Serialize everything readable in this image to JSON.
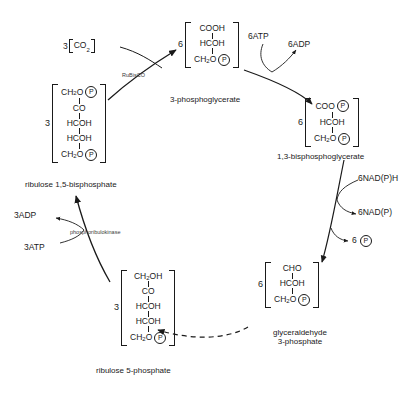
{
  "diagram": {
    "ink_color": "#1a1a1a"
  },
  "molecules": {
    "rubp": {
      "coefficient": "3",
      "groups": [
        "CH",
        "CO",
        "HCOH",
        "HCOH",
        "CH"
      ],
      "g1_main": "CH",
      "g1_sub": "2",
      "g1_tail": "O",
      "g2": "CO",
      "g3": "HCOH",
      "g4": "HCOH",
      "g5_main": "CH",
      "g5_sub": "2",
      "g5_tail": "O",
      "phosphate": "P",
      "caption": "ribulose 1,5-bisphosphate"
    },
    "pga": {
      "coefficient": "6",
      "g1": "COOH",
      "g2": "HCOH",
      "g3_main": "CH",
      "g3_sub": "2",
      "g3_tail": "O",
      "phosphate": "P",
      "caption": "3-phosphoglycerate"
    },
    "bpg": {
      "coefficient": "6",
      "g1": "COO",
      "g2": "HCOH",
      "g3_main": "CH",
      "g3_sub": "2",
      "g3_tail": "O",
      "phosphate": "P",
      "caption": "1,3-bisphosphoglycerate"
    },
    "g3p": {
      "coefficient": "6",
      "g1": "CHO",
      "g2": "HCOH",
      "g3_main": "CH",
      "g3_sub": "2",
      "g3_tail": "O",
      "phosphate": "P",
      "caption_line1": "glyceraldehyde",
      "caption_line2": "3-phosphate"
    },
    "ru5p": {
      "coefficient": "3",
      "g1_main": "CH",
      "g1_sub": "2",
      "g1_tail": "OH",
      "g2": "CO",
      "g3": "HCOH",
      "g4": "HCOH",
      "g5_main": "CH",
      "g5_sub": "2",
      "g5_tail": "O",
      "phosphate": "P",
      "caption": "ribulose 5-phosphate"
    }
  },
  "labels": {
    "co2_coefficient": "3",
    "co2_main": "CO",
    "co2_sub": "2",
    "atp_in_top": "6ATP",
    "adp_out_top": "6ADP",
    "nadph_in": "6NAD(P)H",
    "nadp_out": "6NAD(P)",
    "pi_out_coefficient": "6",
    "pi_out_symbol": "P",
    "adp_out_left": "3ADP",
    "atp_in_left": "3ATP"
  },
  "enzymes": {
    "rubisco": "RuBisCO",
    "phosphoribulokinase": "phosphoribulokinase"
  }
}
